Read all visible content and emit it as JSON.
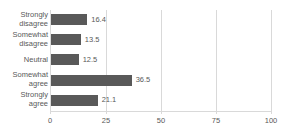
{
  "chart_data": {
    "type": "bar",
    "orientation": "horizontal",
    "title": "",
    "xlabel": "",
    "ylabel": "",
    "categories": [
      "Strongly disagree",
      "Somewhat disagree",
      "Neutral",
      "Somewhat agree",
      "Strongly agree"
    ],
    "values": [
      16.4,
      13.5,
      12.5,
      36.5,
      21.1
    ],
    "value_labels": [
      "16.4",
      "13.5",
      "12.5",
      "36.5",
      "21.1"
    ],
    "xlim": [
      0,
      100
    ],
    "xticks": [
      0,
      25,
      50,
      75,
      100
    ],
    "xtick_labels": [
      "0",
      "25",
      "50",
      "75",
      "100"
    ],
    "grid": "vertical",
    "legend": "none",
    "bar_color": "#595959",
    "grid_color": "#d9d9d9",
    "text_color": "#595959",
    "background": "#ffffff"
  },
  "labels": {
    "cat_0": "Strongly disagree",
    "cat_1": "Somewhat disagree",
    "cat_2": "Neutral",
    "cat_3": "Somewhat agree",
    "cat_4": "Strongly agree"
  }
}
